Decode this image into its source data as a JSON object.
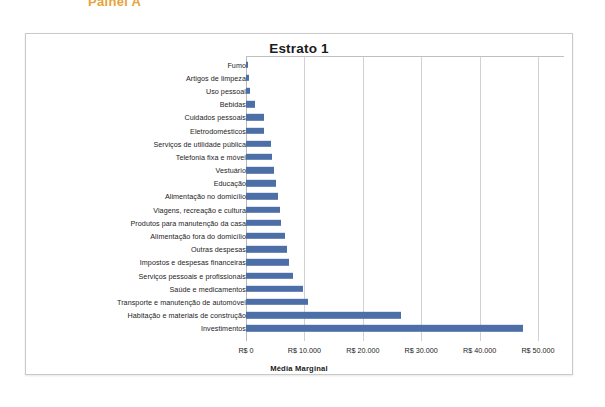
{
  "panel": {
    "label": "Painel A"
  },
  "chart_data": {
    "type": "bar",
    "orientation": "horizontal",
    "title": "Estrato 1",
    "xlabel": "Média Marginal",
    "ylabel": "",
    "xlim": [
      0,
      50000
    ],
    "xticks": [
      0,
      10000,
      20000,
      30000,
      40000,
      50000
    ],
    "xtick_labels": [
      "R$ 0",
      "R$ 10.000",
      "R$ 20.000",
      "R$ 30.000",
      "R$ 40.000",
      "R$ 50.000"
    ],
    "grid": true,
    "legend": false,
    "bar_color": "#4d6fa8",
    "categories": [
      "Fumo",
      "Artigos de limpeza",
      "Uso pessoal",
      "Bebidas",
      "Cuidados pessoais",
      "Eletrodomésticos",
      "Serviços de utilidade pública",
      "Telefonia fixa e móvel",
      "Vestuário",
      "Educação",
      "Alimentação no domicílio",
      "Viagens, recreação e cultura",
      "Produtos para manutenção da casa",
      "Alimentação fora do domicílio",
      "Outras despesas",
      "Impostos e despesas financeiras",
      "Serviços pessoais e profissionais",
      "Saúde e medicamentos",
      "Transporte e manutenção de automóvel",
      "Habitação e materiais de construção",
      "Investimentos"
    ],
    "values": [
      400,
      500,
      700,
      1500,
      3000,
      3100,
      4200,
      4500,
      4800,
      5200,
      5500,
      5900,
      6000,
      6700,
      7100,
      7400,
      8100,
      9800,
      10600,
      26600,
      47500
    ]
  }
}
